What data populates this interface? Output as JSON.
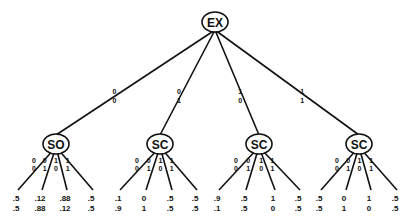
{
  "diagram": {
    "type": "game-tree",
    "root": {
      "label": "EX",
      "x": 215,
      "y": 22,
      "children": [
        {
          "edge_label": [
            "0",
            "0"
          ],
          "label": "SO",
          "x": 56,
          "y": 144,
          "leaves": [
            {
              "edge_label": [
                "0",
                "0"
              ],
              "payoff": [
                ".5",
                ".5"
              ],
              "x": 18
            },
            {
              "edge_label": [
                "0",
                "1"
              ],
              "payoff": [
                ".12",
                ".88"
              ],
              "x": 42
            },
            {
              "edge_label": [
                "1",
                "0"
              ],
              "payoff": [
                ".88",
                ".12"
              ],
              "x": 67
            },
            {
              "edge_label": [
                "1",
                "1"
              ],
              "payoff": [
                ".5",
                ".5"
              ],
              "x": 93
            }
          ]
        },
        {
          "edge_label": [
            "0",
            "1"
          ],
          "label": "SC",
          "x": 160,
          "y": 144,
          "leaves": [
            {
              "edge_label": [
                "0",
                "0"
              ],
              "payoff": [
                ".1",
                ".9"
              ],
              "x": 120
            },
            {
              "edge_label": [
                "0",
                "1"
              ],
              "payoff": [
                "0",
                "1"
              ],
              "x": 146
            },
            {
              "edge_label": [
                "1",
                "0"
              ],
              "payoff": [
                ".5",
                ".5"
              ],
              "x": 172
            },
            {
              "edge_label": [
                "1",
                "1"
              ],
              "payoff": [
                ".5",
                ".5"
              ],
              "x": 197
            }
          ]
        },
        {
          "edge_label": [
            "1",
            "0"
          ],
          "label": "SC",
          "x": 259,
          "y": 144,
          "leaves": [
            {
              "edge_label": [
                "0",
                "0"
              ],
              "payoff": [
                ".9",
                ".1"
              ],
              "x": 219
            },
            {
              "edge_label": [
                "0",
                "1"
              ],
              "payoff": [
                ".5",
                ".5"
              ],
              "x": 246
            },
            {
              "edge_label": [
                "1",
                "0"
              ],
              "payoff": [
                "1",
                "0"
              ],
              "x": 275
            },
            {
              "edge_label": [
                "1",
                "1"
              ],
              "payoff": [
                ".5",
                ".5"
              ],
              "x": 300
            }
          ]
        },
        {
          "edge_label": [
            "1",
            "1"
          ],
          "label": "SC",
          "x": 359,
          "y": 144,
          "leaves": [
            {
              "edge_label": [
                "0",
                "0"
              ],
              "payoff": [
                ".5",
                ".5"
              ],
              "x": 321
            },
            {
              "edge_label": [
                "0",
                "1"
              ],
              "payoff": [
                "0",
                "1"
              ],
              "x": 346
            },
            {
              "edge_label": [
                "1",
                "0"
              ],
              "payoff": [
                "1",
                "0"
              ],
              "x": 371
            },
            {
              "edge_label": [
                "1",
                "1"
              ],
              "payoff": [
                ".5",
                ".5"
              ],
              "x": 397
            }
          ]
        }
      ]
    }
  },
  "colors": {
    "line": "#111111",
    "background": "#ffffff"
  }
}
